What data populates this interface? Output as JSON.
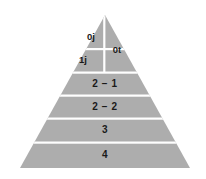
{
  "figure": {
    "background_color": "#ffffff",
    "fill_color": "#adadad",
    "divider_color": "#ffffff",
    "text_color": "#1a1a1a",
    "apex": {
      "x": 105,
      "y": 15
    },
    "base_left": {
      "x": 20,
      "y": 168
    },
    "base_right": {
      "x": 190,
      "y": 168
    },
    "vertical_split_x": 104
  },
  "tiers": [
    {
      "id": "apex-left-top",
      "label": "0j",
      "center_x": 91,
      "center_y": 37,
      "band_top": 15,
      "band_bottom": 48,
      "side": "left"
    },
    {
      "id": "apex-left-bottom",
      "label": "1j",
      "center_x": 83,
      "center_y": 60,
      "band_top": 49,
      "band_bottom": 71,
      "side": "left"
    },
    {
      "id": "apex-right",
      "label": "0t",
      "center_x": 117,
      "center_y": 50,
      "band_top": 15,
      "band_bottom": 71,
      "side": "right"
    },
    {
      "id": "tier-2-1",
      "label": "2 − 1",
      "center_x": 105,
      "center_y": 84,
      "band_top": 73,
      "band_bottom": 94,
      "side": "full"
    },
    {
      "id": "tier-2-2",
      "label": "2 − 2",
      "center_x": 105,
      "center_y": 107,
      "band_top": 96,
      "band_bottom": 117,
      "side": "full"
    },
    {
      "id": "tier-3",
      "label": "3",
      "center_x": 105,
      "center_y": 130,
      "band_top": 119,
      "band_bottom": 141,
      "side": "full"
    },
    {
      "id": "tier-4",
      "label": "4",
      "center_x": 105,
      "center_y": 155,
      "band_top": 143,
      "band_bottom": 168,
      "side": "full"
    }
  ]
}
